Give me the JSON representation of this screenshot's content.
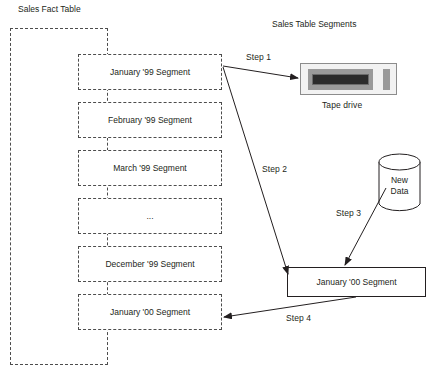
{
  "diagram": {
    "titles": {
      "left": "Sales Fact Table",
      "right": "Sales Table Segments"
    },
    "fact_table_segments": [
      {
        "label": "January '99 Segment"
      },
      {
        "label": "February '99 Segment"
      },
      {
        "label": "March '99 Segment"
      },
      {
        "label": "..."
      },
      {
        "label": "December '99 Segment"
      },
      {
        "label": "January '00 Segment"
      }
    ],
    "nodes": {
      "tape_drive_label": "Tape drive",
      "new_data_line1": "New",
      "new_data_line2": "Data",
      "new_segment_label": "January '00 Segment"
    },
    "steps": [
      {
        "label": "Step 1"
      },
      {
        "label": "Step 2"
      },
      {
        "label": "Step 3"
      },
      {
        "label": "Step 4"
      }
    ],
    "colors": {
      "ink": "#231f20",
      "dash": "#4d4d4d",
      "tape_body": "#f2f2f2",
      "tape_bezel": "#9a9a9a",
      "tape_slot": "#2b2b2b"
    }
  }
}
